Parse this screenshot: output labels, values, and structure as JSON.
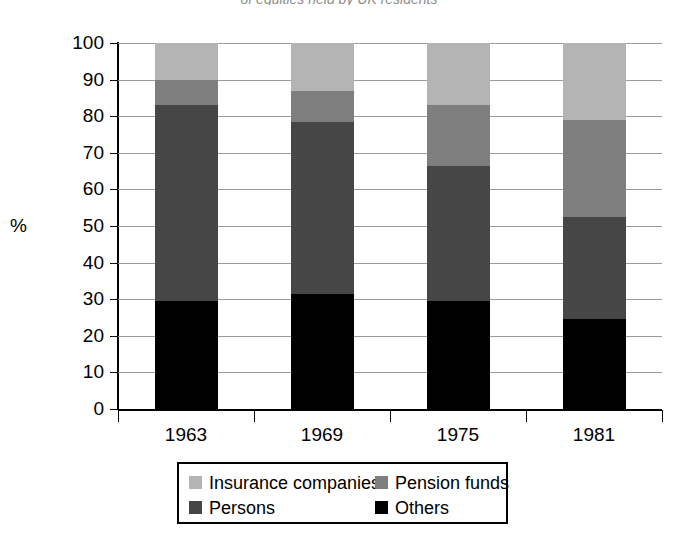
{
  "figure": {
    "clipped_caption": "of equities held by UK residents"
  },
  "chart_data": {
    "type": "bar",
    "stacked": true,
    "title": "",
    "subtitle": "",
    "xlabel": "",
    "ylabel": "%",
    "ylim": [
      0,
      100
    ],
    "ytick_step": 10,
    "yticks": [
      "100",
      "90",
      "80",
      "70",
      "60",
      "50",
      "40",
      "30",
      "20",
      "10",
      "0"
    ],
    "grid": true,
    "legend_position": "bottom",
    "categories": [
      "1963",
      "1969",
      "1975",
      "1981"
    ],
    "series": [
      {
        "name": "Insurance companies",
        "color": "#b4b4b4",
        "values": [
          10.0,
          13.0,
          17.0,
          21.0
        ]
      },
      {
        "name": "Pension funds",
        "color": "#7e7e7e",
        "values": [
          7.0,
          8.5,
          16.5,
          26.5
        ]
      },
      {
        "name": "Persons",
        "color": "#464646",
        "values": [
          53.5,
          47.0,
          37.0,
          28.0
        ]
      },
      {
        "name": "Others",
        "color": "#000000",
        "values": [
          29.5,
          31.5,
          29.5,
          24.5
        ]
      }
    ],
    "stack_order_bottom_to_top": [
      "Others",
      "Persons",
      "Pension funds",
      "Insurance companies"
    ],
    "cumulative_tops": {
      "1963": [
        29.5,
        83.0,
        90.0,
        100.0
      ],
      "1969": [
        31.5,
        78.5,
        87.0,
        100.0
      ],
      "1975": [
        29.5,
        66.5,
        83.0,
        100.0
      ],
      "1981": [
        24.5,
        52.5,
        79.0,
        100.0
      ]
    }
  },
  "legend": {
    "rows": [
      [
        {
          "label": "Insurance companies",
          "color": "#b4b4b4"
        },
        {
          "label": "Pension funds",
          "color": "#7e7e7e"
        }
      ],
      [
        {
          "label": "Persons",
          "color": "#464646"
        },
        {
          "label": "Others",
          "color": "#000000"
        }
      ]
    ]
  }
}
